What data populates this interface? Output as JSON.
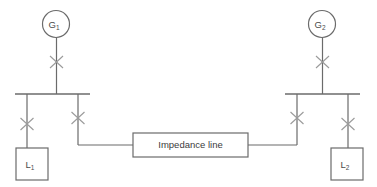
{
  "diagram": {
    "background_color": "#ffffff",
    "line_color": "#6b6b6b",
    "breaker_color": "#9a9a9a",
    "text_color": "#4a4a4a"
  },
  "generators": [
    {
      "id": "g1",
      "label": "G",
      "subscript": "1",
      "symbol": "circle"
    },
    {
      "id": "g2",
      "label": "G",
      "subscript": "2",
      "symbol": "circle"
    }
  ],
  "loads": [
    {
      "id": "l1",
      "label": "L",
      "subscript": "1",
      "symbol": "square"
    },
    {
      "id": "l2",
      "label": "L",
      "subscript": "2",
      "symbol": "square"
    }
  ],
  "tie_line": {
    "label": "Impedance line",
    "symbol": "rectangle"
  },
  "buses": [
    {
      "id": "bus1",
      "name": "left-busbar"
    },
    {
      "id": "bus2",
      "name": "right-busbar"
    }
  ],
  "breakers": [
    {
      "id": "cb-g1",
      "name": "breaker-generator-1",
      "symbol": "X"
    },
    {
      "id": "cb-l1",
      "name": "breaker-load-1",
      "symbol": "X"
    },
    {
      "id": "cb-tie-left",
      "name": "breaker-tie-left",
      "symbol": "X"
    },
    {
      "id": "cb-g2",
      "name": "breaker-generator-2",
      "symbol": "X"
    },
    {
      "id": "cb-l2",
      "name": "breaker-load-2",
      "symbol": "X"
    },
    {
      "id": "cb-tie-right",
      "name": "breaker-tie-right",
      "symbol": "X"
    }
  ]
}
